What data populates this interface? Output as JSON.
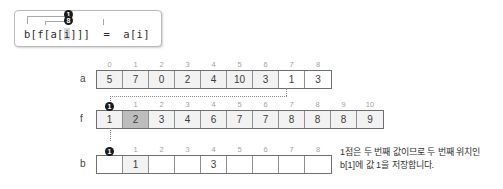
{
  "code_box": {
    "prefix": "b[f[a[",
    "highlight": "i",
    "suffix": "]]]  =  a[i]",
    "full_text": "b[f[a[i]]]  =  a[i]",
    "annotations": [
      {
        "label": "1",
        "name": "badge-one"
      },
      {
        "label": "8",
        "name": "badge-eight"
      }
    ]
  },
  "rows": [
    {
      "name": "a",
      "label": "a",
      "indices": [
        "0",
        "1",
        "2",
        "3",
        "4",
        "5",
        "6",
        "7",
        "8"
      ],
      "values": [
        "5",
        "7",
        "0",
        "2",
        "4",
        "10",
        "3",
        "1",
        "3"
      ],
      "shades": [
        "light",
        "light",
        "light",
        "light",
        "light",
        "light",
        "light",
        "white",
        "white"
      ]
    },
    {
      "name": "f",
      "label": "f",
      "indices": [
        "0",
        "1",
        "2",
        "3",
        "4",
        "5",
        "6",
        "7",
        "8",
        "9",
        "10"
      ],
      "values": [
        "1",
        "2",
        "3",
        "4",
        "6",
        "7",
        "7",
        "8",
        "8",
        "8",
        "9"
      ],
      "shades": [
        "light",
        "dark",
        "light",
        "light",
        "light",
        "light",
        "light",
        "light",
        "light",
        "light",
        "light"
      ]
    },
    {
      "name": "b",
      "label": "b",
      "indices": [
        "0",
        "1",
        "2",
        "3",
        "4",
        "5",
        "6",
        "7",
        "8"
      ],
      "values": [
        "",
        "1",
        "",
        "",
        "3",
        "",
        "",
        "",
        ""
      ],
      "shades": [
        "white",
        "light",
        "white",
        "white",
        "white",
        "white",
        "white",
        "white",
        "white"
      ]
    }
  ],
  "markers": [
    {
      "name": "marker-f-index-1",
      "label": "1"
    },
    {
      "name": "marker-b-index-1",
      "label": "1"
    }
  ],
  "caption": {
    "line1": "1점은 두 번째 값이므로 두 번째 위치인",
    "line2": "b[1]에 값 1을 저장합니다."
  },
  "colors": {
    "cell_fill": "#d6d6d6",
    "cell_light": "#f2f2f2",
    "cell_dark": "#bdbdbd",
    "border": "#6e6e6e",
    "marker": "#1a1a1a",
    "index_text": "#a2a2a2"
  }
}
